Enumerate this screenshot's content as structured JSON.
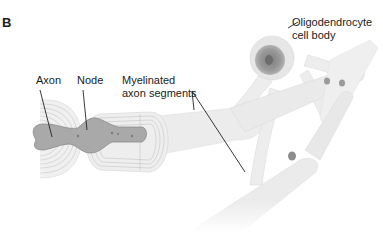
{
  "figure": {
    "panel_letter": "B",
    "labels": {
      "axon": "Axon",
      "node": "Node",
      "myelinated_line1": "Myelinated",
      "myelinated_line2": "axon segments",
      "oligo_line1": "Oligodendrocyte",
      "oligo_line2": "cell body"
    },
    "colors": {
      "axon_fill": "#a9a9a9",
      "axon_stroke": "#8a8a8a",
      "myelin_fill": "#e9e9e9",
      "myelin_lines": "#bdbdbd",
      "process_fill": "#ececec",
      "cell_body_outer": "#e2e2e2",
      "nucleus": "#8f8f8f",
      "nucleolus": "#6f6f6f",
      "leader_line": "#222222"
    }
  }
}
